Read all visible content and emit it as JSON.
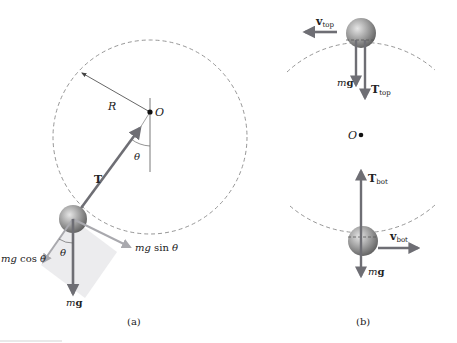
{
  "panel_a": {
    "caption": "(a)",
    "pivot_label": "O",
    "radius_label": "R",
    "tension_label": "T",
    "angle_label_pivot": "θ",
    "angle_label_ball": "θ",
    "weight_label_m": "m",
    "weight_label_g": "g",
    "radial_component": {
      "m": "mg",
      "fn": " cos ",
      "theta": "θ"
    },
    "tangential_component": {
      "m": "mg",
      "fn": " sin ",
      "theta": "θ"
    }
  },
  "panel_b": {
    "caption": "(b)",
    "center_label": "O",
    "top": {
      "v_main": "v",
      "v_sub": "top",
      "t_main": "T",
      "t_sub": "top",
      "weight_m": "m",
      "weight_g": "g"
    },
    "bottom": {
      "v_main": "v",
      "v_sub": "bot",
      "t_main": "T",
      "t_sub": "bot",
      "weight_m": "m",
      "weight_g": "g"
    }
  },
  "colors": {
    "arrow": "#6e6e74",
    "arrow_light": "#a9a9ae",
    "dash": "#8a8a8a",
    "shade": "#ececee",
    "ball": "#9a9a9a"
  }
}
